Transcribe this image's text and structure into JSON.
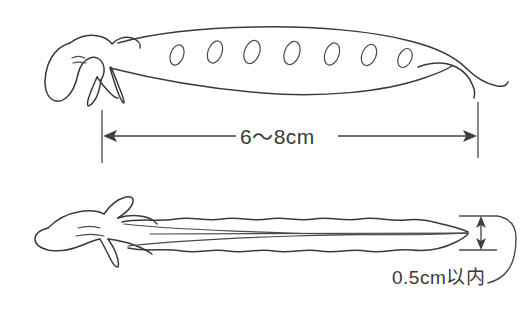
{
  "figure": {
    "background_color": "#ffffff",
    "line_color": "#3a3a3a",
    "text_color": "#3a3a3a"
  },
  "views": [
    {
      "name": "side-view-pod",
      "description": "Side view of pea pod with stem and calyx at left, seven seed bulges visible along the upper edge, tapering beak-like tip at right",
      "seed_count": 7
    },
    {
      "name": "edge-view-pod",
      "description": "Edge-on view of the same pea pod showing flat profile with wavy margins and pointed tip"
    }
  ],
  "dimensions": {
    "length": {
      "label": "6〜8cm",
      "orientation": "horizontal",
      "arrow_style": "double-headed"
    },
    "thickness": {
      "label": "0.5cm以内",
      "orientation": "vertical",
      "arrow_style": "double-headed"
    }
  }
}
